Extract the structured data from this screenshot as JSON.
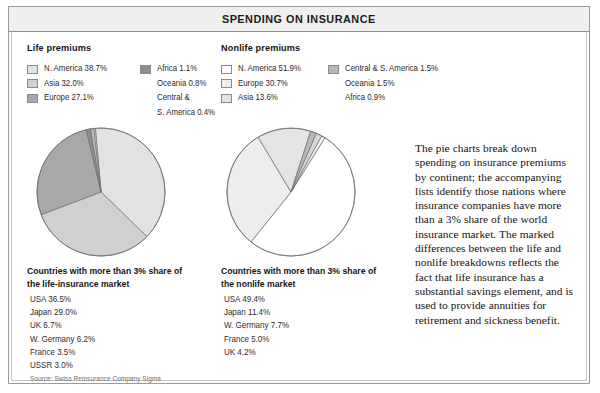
{
  "title": "SPENDING ON INSURANCE",
  "panels": {
    "life": {
      "heading": "Life premiums",
      "legend_col1": [
        {
          "label": "N. America 38.7%",
          "color": "#e2e2e2"
        },
        {
          "label": "Asia 32.0%",
          "color": "#d0d0d0"
        },
        {
          "label": "Europe 27.1%",
          "color": "#a8a8a8"
        }
      ],
      "legend_col2": [
        {
          "label": "Africa 1.1%",
          "color": "#8f8f8f"
        },
        {
          "label": "Oceania 0.8%",
          "color": null
        },
        {
          "label": "Central &",
          "color": null
        },
        {
          "label": "S. America 0.4%",
          "color": null
        }
      ],
      "list_title_line1": "Countries with more than 3% share of",
      "list_title_line2": "the life-insurance market",
      "countries": [
        "USA 36.5%",
        "Japan 29.0%",
        "UK 6.7%",
        "W. Germany 6.2%",
        "France 3.5%",
        "USSR 3.0%"
      ],
      "source": "Source: Swiss Reinsurance Company Sigma"
    },
    "nonlife": {
      "heading": "Nonlife premiums",
      "legend_col1": [
        {
          "label": "N. America 51.9%",
          "color": "#ffffff"
        },
        {
          "label": "Europe 30.7%",
          "color": "#ededed"
        },
        {
          "label": "Asia 13.6%",
          "color": "#e4e4e4"
        }
      ],
      "legend_col2": [
        {
          "label": "Central & S. America 1.5%",
          "color": "#b8b8b8"
        },
        {
          "label": "Oceania 1.5%",
          "color": null
        },
        {
          "label": "Africa 0.9%",
          "color": null
        }
      ],
      "list_title_line1": "Countries with more than 3% share of",
      "list_title_line2": "the nonlife market",
      "countries": [
        "USA 49.4%",
        "Japan 11.4%",
        "W. Germany 7.7%",
        "France 5.0%",
        "UK 4.2%"
      ],
      "source": ""
    }
  },
  "body_copy": "The pie charts break down spending on insurance premiums by continent; the accompanying lists identify those nations where insurance companies have more than a 3% share of the world insurance market. The marked differences between the life and nonlife breakdowns reflects the fact that life insurance has a substantial savings element, and is used to provide annuities for retirement and sickness benefit.",
  "chart_data": [
    {
      "type": "pie",
      "title": "Life premiums",
      "labels": [
        "N. America",
        "Asia",
        "Europe",
        "Africa",
        "Oceania",
        "Central & S. America"
      ],
      "values": [
        38.7,
        32.0,
        27.1,
        1.1,
        0.8,
        0.4
      ],
      "colors": [
        "#e2e2e2",
        "#d0d0d0",
        "#a8a8a8",
        "#8f8f8f",
        "#c4c4c4",
        "#dadada"
      ],
      "unit": "%",
      "start_angle": -95,
      "direction": "clockwise",
      "legend_position": "top",
      "radius_px": 64
    },
    {
      "type": "pie",
      "title": "Nonlife premiums",
      "labels": [
        "N. America",
        "Europe",
        "Asia",
        "Central & S. America",
        "Oceania",
        "Africa"
      ],
      "values": [
        51.9,
        30.7,
        13.6,
        1.5,
        1.5,
        0.9
      ],
      "colors": [
        "#ffffff",
        "#ededed",
        "#e4e4e4",
        "#b8b8b8",
        "#d6d6d6",
        "#f2f2f2"
      ],
      "unit": "%",
      "start_angle": -58,
      "direction": "clockwise",
      "legend_position": "top",
      "radius_px": 64
    },
    {
      "type": "table",
      "title": "Countries with more than 3% share of the life-insurance market",
      "categories": [
        "USA",
        "Japan",
        "UK",
        "W. Germany",
        "France",
        "USSR"
      ],
      "values": [
        36.5,
        29.0,
        6.7,
        6.2,
        3.5,
        3.0
      ],
      "unit": "%"
    },
    {
      "type": "table",
      "title": "Countries with more than 3% share of the nonlife market",
      "categories": [
        "USA",
        "Japan",
        "W. Germany",
        "France",
        "UK"
      ],
      "values": [
        49.4,
        11.4,
        7.7,
        5.0,
        4.2
      ],
      "unit": "%"
    }
  ]
}
